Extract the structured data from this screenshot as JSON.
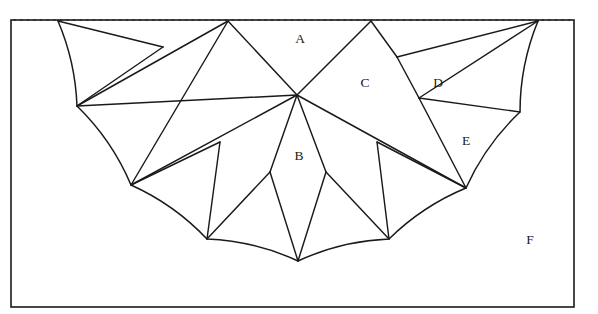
{
  "figure": {
    "canvas": {
      "width": 598,
      "height": 314
    },
    "colors": {
      "ink": "#1a1a1a",
      "dotted": "#2b2b2b",
      "background": "#ffffff"
    },
    "frame": {
      "name": "outer-rectangle-border",
      "x": 11,
      "y": 20,
      "width": 563,
      "height": 287
    },
    "diameter_line": {
      "name": "dotted-diameter",
      "style": "dotted",
      "x1": 14,
      "y1": 20,
      "x2": 572,
      "y2": 20
    },
    "semicircle": {
      "center_x": 298,
      "center_y": 21,
      "radius": 240,
      "left_endpoint": [
        58,
        21
      ],
      "right_endpoint": [
        538,
        21
      ],
      "bottom_point": [
        298,
        261
      ]
    },
    "vertices": {
      "arc_left": [
        58,
        21
      ],
      "arc_right": [
        538,
        21
      ],
      "arc_p1": [
        77,
        106
      ],
      "arc_p2": [
        131,
        185
      ],
      "arc_p3": [
        207,
        239
      ],
      "arc_p4": [
        298,
        261
      ],
      "arc_p5": [
        389,
        239
      ],
      "arc_p6": [
        466,
        188
      ],
      "arc_p7": [
        520,
        112
      ],
      "peak_left": [
        228,
        21
      ],
      "peak_right": [
        371,
        21
      ],
      "center_node": [
        297,
        95
      ],
      "node_left_upper": [
        163,
        47
      ],
      "node_right_upper": [
        397,
        57
      ],
      "node_right_mid": [
        419,
        98
      ],
      "fan_left": [
        220,
        142
      ],
      "fan_left_in": [
        270,
        172
      ],
      "fan_right_in": [
        326,
        172
      ],
      "fan_right": [
        377,
        142
      ]
    },
    "labels": [
      {
        "text": "A",
        "x": 300,
        "y": 40,
        "name": "region-label-a"
      },
      {
        "text": "C",
        "x": 365,
        "y": 84,
        "name": "region-label-c"
      },
      {
        "text": "D",
        "x": 438,
        "y": 84,
        "name": "region-label-d"
      },
      {
        "text": "E",
        "x": 466,
        "y": 142,
        "name": "region-label-e"
      },
      {
        "text": "B",
        "x": 299,
        "y": 157,
        "name": "region-label-b"
      },
      {
        "text": "F",
        "x": 530,
        "y": 241,
        "name": "region-label-f"
      }
    ],
    "arc_segments": [
      {
        "name": "arc-seg-1",
        "from": [
          58,
          21
        ],
        "to": [
          77,
          106
        ]
      },
      {
        "name": "arc-seg-2",
        "from": [
          77,
          106
        ],
        "to": [
          131,
          185
        ]
      },
      {
        "name": "arc-seg-3",
        "from": [
          131,
          185
        ],
        "to": [
          207,
          239
        ]
      },
      {
        "name": "arc-seg-4",
        "from": [
          207,
          239
        ],
        "to": [
          298,
          261
        ]
      },
      {
        "name": "arc-seg-5",
        "from": [
          298,
          261
        ],
        "to": [
          389,
          239
        ]
      },
      {
        "name": "arc-seg-6",
        "from": [
          389,
          239
        ],
        "to": [
          466,
          188
        ]
      },
      {
        "name": "arc-seg-7",
        "from": [
          466,
          188
        ],
        "to": [
          520,
          112
        ]
      },
      {
        "name": "arc-seg-8",
        "from": [
          520,
          112
        ],
        "to": [
          538,
          21
        ]
      }
    ],
    "chords": [
      {
        "name": "chord-arcleft-to-nodeleftupper",
        "from": [
          58,
          21
        ],
        "to": [
          163,
          47
        ]
      },
      {
        "name": "chord-nodeleftupper-to-arcp1",
        "from": [
          163,
          47
        ],
        "to": [
          77,
          106
        ]
      },
      {
        "name": "chord-arcp1-to-peakleft",
        "from": [
          77,
          106
        ],
        "to": [
          228,
          21
        ]
      },
      {
        "name": "chord-arcp1-to-centernode",
        "from": [
          77,
          106
        ],
        "to": [
          297,
          95
        ]
      },
      {
        "name": "chord-peakleft-to-centernode",
        "from": [
          228,
          21
        ],
        "to": [
          297,
          95
        ]
      },
      {
        "name": "chord-peakleft-to-arcp2",
        "from": [
          228,
          21
        ],
        "to": [
          131,
          185
        ]
      },
      {
        "name": "chord-arcp2-to-centernode",
        "from": [
          131,
          185
        ],
        "to": [
          297,
          95
        ]
      },
      {
        "name": "chord-arcp2-to-fanleft",
        "from": [
          131,
          185
        ],
        "to": [
          220,
          142
        ]
      },
      {
        "name": "chord-fanleft-to-arcp3",
        "from": [
          220,
          142
        ],
        "to": [
          207,
          239
        ]
      },
      {
        "name": "chord-arcp3-to-fanleftin",
        "from": [
          207,
          239
        ],
        "to": [
          270,
          172
        ]
      },
      {
        "name": "chord-fanleftin-to-arcp4",
        "from": [
          270,
          172
        ],
        "to": [
          298,
          261
        ]
      },
      {
        "name": "chord-fanleftin-to-centernode",
        "from": [
          270,
          172
        ],
        "to": [
          297,
          95
        ]
      },
      {
        "name": "chord-arcp4-to-fanrightin",
        "from": [
          298,
          261
        ],
        "to": [
          326,
          172
        ]
      },
      {
        "name": "chord-fanrightin-to-centernode",
        "from": [
          326,
          172
        ],
        "to": [
          297,
          95
        ]
      },
      {
        "name": "chord-fanrightin-to-arcp5",
        "from": [
          326,
          172
        ],
        "to": [
          389,
          239
        ]
      },
      {
        "name": "chord-arcp5-to-fanright",
        "from": [
          389,
          239
        ],
        "to": [
          377,
          142
        ]
      },
      {
        "name": "chord-fanright-to-arcp6",
        "from": [
          377,
          142
        ],
        "to": [
          466,
          188
        ]
      },
      {
        "name": "chord-centernode-to-arcp6",
        "from": [
          297,
          95
        ],
        "to": [
          466,
          188
        ]
      },
      {
        "name": "chord-centernode-to-peakright",
        "from": [
          297,
          95
        ],
        "to": [
          371,
          21
        ]
      },
      {
        "name": "chord-peakright-to-noderightupper",
        "from": [
          371,
          21
        ],
        "to": [
          397,
          57
        ]
      },
      {
        "name": "chord-noderightupper-to-arcright",
        "from": [
          397,
          57
        ],
        "to": [
          538,
          21
        ]
      },
      {
        "name": "chord-noderightupper-to-noderightmid",
        "from": [
          397,
          57
        ],
        "to": [
          419,
          98
        ]
      },
      {
        "name": "chord-noderightmid-to-arcright",
        "from": [
          419,
          98
        ],
        "to": [
          538,
          21
        ]
      },
      {
        "name": "chord-noderightmid-to-arcp7",
        "from": [
          419,
          98
        ],
        "to": [
          520,
          112
        ]
      },
      {
        "name": "chord-noderightmid-to-arcp6",
        "from": [
          419,
          98
        ],
        "to": [
          466,
          188
        ]
      }
    ]
  }
}
